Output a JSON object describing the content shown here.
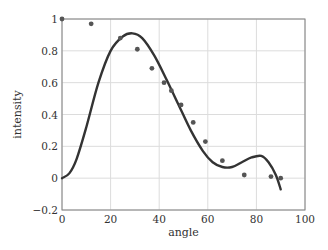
{
  "chart_data": {
    "type": "scatter",
    "title": "",
    "xlabel": "angle",
    "ylabel": "intensity",
    "xlim": [
      0,
      100
    ],
    "ylim": [
      -0.2,
      1
    ],
    "xticks": [
      0,
      20,
      40,
      60,
      80,
      100
    ],
    "yticks": [
      -0.2,
      0,
      0.2,
      0.4,
      0.6,
      0.8,
      1
    ],
    "xtick_labels": [
      "0",
      "20",
      "40",
      "60",
      "80",
      "100"
    ],
    "ytick_labels": [
      "−0.2",
      "0",
      "0.2",
      "0.4",
      "0.6",
      "0.8",
      "1"
    ],
    "grid": true,
    "legend": null,
    "series": [
      {
        "name": "measured",
        "type": "scatter",
        "color": "#555555",
        "x": [
          0,
          12,
          24,
          31,
          37,
          42,
          45,
          49,
          54,
          59,
          66,
          75,
          86,
          90
        ],
        "y": [
          1.0,
          0.97,
          0.88,
          0.81,
          0.69,
          0.6,
          0.55,
          0.46,
          0.35,
          0.23,
          0.11,
          0.02,
          0.01,
          0.0
        ]
      },
      {
        "name": "fit",
        "type": "line",
        "color": "#333333",
        "x": [
          0,
          3,
          6,
          10,
          15,
          20,
          25,
          29,
          33,
          38,
          43,
          48,
          53,
          58,
          62,
          66,
          70,
          74,
          78,
          82,
          85,
          88,
          90
        ],
        "y": [
          0.0,
          0.03,
          0.12,
          0.32,
          0.6,
          0.8,
          0.89,
          0.91,
          0.88,
          0.77,
          0.62,
          0.46,
          0.3,
          0.17,
          0.1,
          0.07,
          0.07,
          0.1,
          0.13,
          0.14,
          0.1,
          0.02,
          -0.07
        ]
      }
    ]
  }
}
